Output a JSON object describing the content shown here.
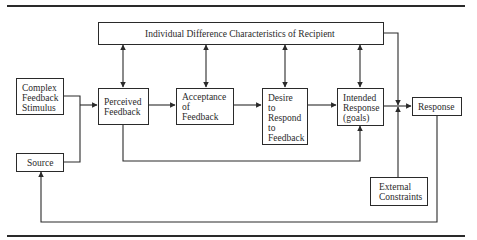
{
  "diagram": {
    "boxes": {
      "top": "Individual Difference Characteristics of Recipient",
      "stimulus": "Complex\nFeedback\nStimulus",
      "source": "Source",
      "perceived": "Perceived\nFeedback",
      "acceptance": "Acceptance\nof\nFeedback",
      "desire": "Desire\nto\nRespond\nto\nFeedback",
      "intended": "Intended\nResponse\n(goals)",
      "response": "Response",
      "external": "External\nConstraints"
    },
    "edges": [
      {
        "from": "stimulus",
        "to": "perceived"
      },
      {
        "from": "source",
        "to": "perceived"
      },
      {
        "from": "perceived",
        "to": "acceptance"
      },
      {
        "from": "acceptance",
        "to": "desire"
      },
      {
        "from": "desire",
        "to": "intended"
      },
      {
        "from": "intended",
        "to": "response"
      },
      {
        "from": "perceived",
        "to": "intended"
      },
      {
        "from": "top",
        "to": "perceived",
        "bidirectional": true
      },
      {
        "from": "top",
        "to": "acceptance",
        "bidirectional": true
      },
      {
        "from": "top",
        "to": "desire",
        "bidirectional": true
      },
      {
        "from": "top",
        "to": "intended",
        "bidirectional": true
      },
      {
        "from": "top",
        "to": "response"
      },
      {
        "from": "external",
        "to": "response"
      },
      {
        "from": "response",
        "to": "source"
      }
    ],
    "colors": {
      "line": "#2a2a2a",
      "background": "#ffffff"
    }
  }
}
